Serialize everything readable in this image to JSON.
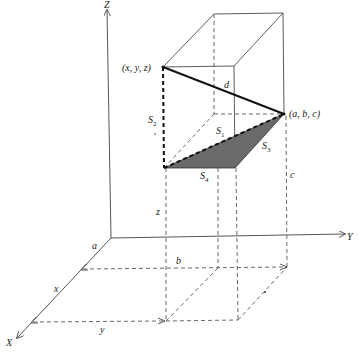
{
  "figure": {
    "type": "3d-distance-diagram",
    "axes": {
      "x_label": "X",
      "y_label": "Y",
      "z_label": "Z"
    },
    "points": {
      "p1_label": "(x, y, z)",
      "p2_label": "(a, b, c)"
    },
    "segments": {
      "d_label": "d",
      "s1_label": "S",
      "s1_sub": "1",
      "s2_label": "S",
      "s2_sub": "2",
      "s3_label": "S",
      "s3_sub": "3",
      "s4_label": "S",
      "s4_sub": "4"
    },
    "dimension_labels": {
      "a": "a",
      "b": "b",
      "c": "c",
      "x": "x",
      "y": "y",
      "z": "z"
    },
    "colors": {
      "shaded_triangle": "#6a6a6a",
      "lines": "#333333"
    }
  }
}
